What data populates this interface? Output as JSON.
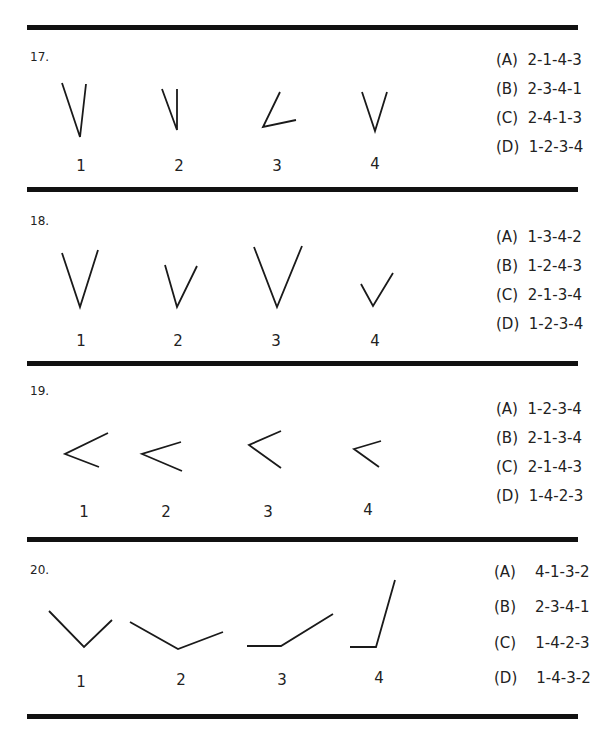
{
  "questions": [
    {
      "number": "17.",
      "figure_labels": [
        "1",
        "2",
        "3",
        "4"
      ],
      "options": [
        "(A)  2-1-4-3",
        "(B)  2-3-4-1",
        "(C)  2-4-1-3",
        "(D)  1-2-3-4"
      ]
    },
    {
      "number": "18.",
      "figure_labels": [
        "1",
        "2",
        "3",
        "4"
      ],
      "options": [
        "(A)  1-3-4-2",
        "(B)  1-2-4-3",
        "(C)  2-1-3-4",
        "(D)  1-2-3-4"
      ]
    },
    {
      "number": "19.",
      "figure_labels": [
        "1",
        "2",
        "3",
        "4"
      ],
      "options": [
        "(A)  1-2-3-4",
        "(B)  2-1-3-4",
        "(C)  2-1-4-3",
        "(D)  1-4-2-3"
      ]
    },
    {
      "number": "20.",
      "figure_labels": [
        "1",
        "2",
        "3",
        "4"
      ],
      "options": [
        "(A)    4-1-3-2",
        "(B)    2-3-4-1",
        "(C)    1-4-2-3",
        "(D)    1-4-3-2"
      ]
    }
  ],
  "figures": {
    "q17": [
      "62,83 80,137 86,84",
      "162,89 177,130 177,89",
      "280,92 263,127 296,120",
      "362,92 375,131 387,92"
    ],
    "q18": [
      "62,253 80,307 98,250",
      "165,265 177,307 197,266",
      "254,247 277,307 302,246",
      "361,284 373,306 393,273"
    ],
    "q19": [
      "108,433 65,454 99,467",
      "181,442 142,454 182,471",
      "281,431 249,445 281,468",
      "381,441 354,449 379,467"
    ],
    "q20": [
      "49,611 84,647 112,620",
      "130,622 178,649 223,632",
      "247,646 281,646 333,614",
      "350,647 376,647 395,580"
    ]
  }
}
